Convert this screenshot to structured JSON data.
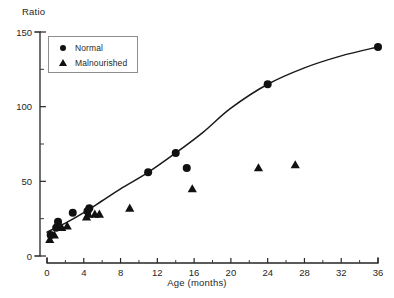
{
  "chart_data": {
    "type": "scatter",
    "title": "",
    "xlabel": "Age  (months)",
    "ylabel": "Ratio",
    "xlim": [
      0,
      36
    ],
    "ylim": [
      0,
      150
    ],
    "x_ticks_major": [
      0,
      4,
      8,
      12,
      16,
      20,
      24,
      28,
      32,
      36
    ],
    "x_ticks_minor": [
      2,
      6,
      10,
      14,
      18,
      22,
      26,
      30,
      34
    ],
    "y_ticks_major": [
      0,
      50,
      100,
      150
    ],
    "y_ticks_minor": [
      25,
      75,
      125
    ],
    "grid": false,
    "legend_position": "top-left",
    "series": [
      {
        "name": "Normal",
        "marker": "circle",
        "color": "#111111",
        "points": [
          {
            "x": 0.4,
            "y": 14
          },
          {
            "x": 1.0,
            "y": 19
          },
          {
            "x": 1.2,
            "y": 23
          },
          {
            "x": 2.8,
            "y": 29
          },
          {
            "x": 4.4,
            "y": 30
          },
          {
            "x": 4.6,
            "y": 32
          },
          {
            "x": 11.0,
            "y": 56
          },
          {
            "x": 14.0,
            "y": 69
          },
          {
            "x": 15.2,
            "y": 59
          },
          {
            "x": 24.0,
            "y": 115
          },
          {
            "x": 36.0,
            "y": 140
          }
        ]
      },
      {
        "name": "Malnourished",
        "marker": "triangle",
        "color": "#111111",
        "points": [
          {
            "x": 0.3,
            "y": 11
          },
          {
            "x": 0.8,
            "y": 14
          },
          {
            "x": 1.6,
            "y": 19
          },
          {
            "x": 2.2,
            "y": 20
          },
          {
            "x": 4.3,
            "y": 26
          },
          {
            "x": 4.5,
            "y": 28
          },
          {
            "x": 5.2,
            "y": 28
          },
          {
            "x": 5.7,
            "y": 28
          },
          {
            "x": 9.0,
            "y": 32
          },
          {
            "x": 15.8,
            "y": 45
          },
          {
            "x": 23.0,
            "y": 59
          },
          {
            "x": 27.0,
            "y": 61
          }
        ]
      }
    ],
    "fit_curve": {
      "name": "Normal trend",
      "points": [
        {
          "x": 0.0,
          "y": 16
        },
        {
          "x": 2.0,
          "y": 22
        },
        {
          "x": 4.0,
          "y": 29
        },
        {
          "x": 6.0,
          "y": 37
        },
        {
          "x": 8.0,
          "y": 45
        },
        {
          "x": 11.0,
          "y": 56
        },
        {
          "x": 14.0,
          "y": 69
        },
        {
          "x": 17.0,
          "y": 83
        },
        {
          "x": 20.0,
          "y": 99
        },
        {
          "x": 24.0,
          "y": 115
        },
        {
          "x": 28.0,
          "y": 126
        },
        {
          "x": 32.0,
          "y": 134
        },
        {
          "x": 36.0,
          "y": 140
        }
      ]
    }
  },
  "legend": {
    "entries": [
      {
        "label": "Normal",
        "marker": "circle"
      },
      {
        "label": "Malnourished",
        "marker": "triangle"
      }
    ]
  },
  "axes": {
    "y_title": "Ratio",
    "x_title": "Age  (months)"
  }
}
